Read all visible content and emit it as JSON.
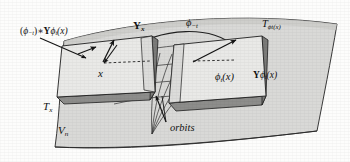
{
  "figure": {
    "name": "manifold-tangent-planes-orbits-diagram",
    "domain": "mathematical-diagram",
    "width": 350,
    "height": 162,
    "background_color": "#fdfdfc",
    "ink_color": "#1a1a1a",
    "surface_fill": "#d8d8d6",
    "plane_fill": "#e8e8e6",
    "plane_edge_fill": "#8a8a88"
  },
  "labels": {
    "pushforward_vector": "(ϕ−t)∗Yϕt(x)",
    "pushforward_parts": {
      "open": "(",
      "phi": "ϕ",
      "sub_minus_t": "−t",
      "close_star": ")∗",
      "Y": "Y",
      "phi2": "ϕ",
      "sub_t": "t",
      "arg": "(x)"
    },
    "vector_field_at_x": "Y",
    "vector_field_at_x_sub": "x",
    "flow_backward": "ϕ",
    "flow_backward_sub": "−t",
    "tangent_space_at_phitx": "T",
    "tangent_space_at_phitx_sub": "ϕt(x)",
    "base_point": "x",
    "image_point": "ϕ",
    "image_point_sub": "t",
    "image_point_arg": "(x)",
    "vector_field_at_phitx_Y": "Y",
    "vector_field_at_phitx_rest": "ϕ",
    "vector_field_at_phitx_sub": "t",
    "vector_field_at_phitx_arg": "(x)",
    "tangent_space_at_x": "T",
    "tangent_space_at_x_sub": "x",
    "manifold": "V",
    "manifold_sub": "n",
    "orbits": "orbits"
  },
  "elements": {
    "manifold_surface": "curved-quadrilateral-sheet",
    "left_tangent_plane": "T_x tangent plane parallelogram",
    "right_tangent_plane": "T_phi_t(x) tangent plane parallelogram",
    "orbit_curves": "family of curves converging to a point below",
    "dashed_connector_left": "dashed horizontal segment at x",
    "dashed_connector_right": "dashed horizontal segment at phi_t(x)",
    "arrow_pushforward_leader": "leader line from label to left plane",
    "arrow_vector_small": "short filled arrow in left plane",
    "arrow_vector_Yx": "upward filled arrow in left plane",
    "arrow_vector_Yphitx": "upward-right filled arrow in right plane",
    "arrow_orbits_leader": "leader line from orbits label to orbit curves",
    "arrow_flow_arc": "arc from right plane to left plane (phi_-t)"
  }
}
